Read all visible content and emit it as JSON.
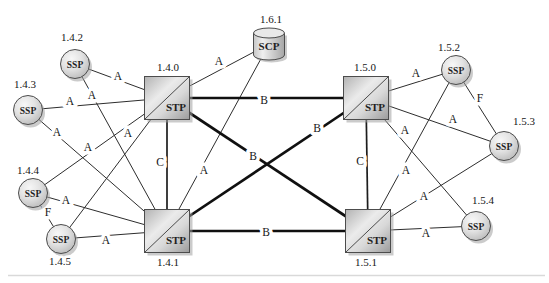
{
  "palette": {
    "background": "#ffffff",
    "line_thin": "#2d2d2d",
    "line_bold": "#101010",
    "node_border": "#4c4c4c",
    "node_fill_light": "#ececec",
    "node_fill_dark": "#9e9e9e",
    "shadow": "#a0a0a0",
    "text": "#161616",
    "page_rule": "#d9d9d9"
  },
  "diagram": {
    "nodes": [
      {
        "id": "1.4.0",
        "kind": "stp",
        "body_text": "STP",
        "label": "1.4.0",
        "x": 167,
        "y": 98,
        "label_x": 168,
        "label_y": 67
      },
      {
        "id": "1.4.1",
        "kind": "stp",
        "body_text": "STP",
        "label": "1.4.1",
        "x": 167,
        "y": 231,
        "label_x": 168,
        "label_y": 262
      },
      {
        "id": "1.5.0",
        "kind": "stp",
        "body_text": "STP",
        "label": "1.5.0",
        "x": 366,
        "y": 98,
        "label_x": 365,
        "label_y": 67
      },
      {
        "id": "1.5.1",
        "kind": "stp",
        "body_text": "STP",
        "label": "1.5.1",
        "x": 368,
        "y": 231,
        "label_x": 366,
        "label_y": 262
      },
      {
        "id": "1.6.1",
        "kind": "scp",
        "body_text": "SCP",
        "label": "1.6.1",
        "x": 269,
        "y": 44,
        "label_x": 271,
        "label_y": 19
      },
      {
        "id": "1.4.2",
        "kind": "ssp",
        "body_text": "SSP",
        "label": "1.4.2",
        "x": 75,
        "y": 64,
        "label_x": 72,
        "label_y": 37
      },
      {
        "id": "1.4.3",
        "kind": "ssp",
        "body_text": "SSP",
        "label": "1.4.3",
        "x": 28,
        "y": 110,
        "label_x": 25,
        "label_y": 84
      },
      {
        "id": "1.4.4",
        "kind": "ssp",
        "body_text": "SSP",
        "label": "1.4.4",
        "x": 33,
        "y": 193,
        "label_x": 28,
        "label_y": 170
      },
      {
        "id": "1.4.5",
        "kind": "ssp",
        "body_text": "SSP",
        "label": "1.4.5",
        "x": 61,
        "y": 239,
        "label_x": 60,
        "label_y": 261
      },
      {
        "id": "1.5.2",
        "kind": "ssp",
        "body_text": "SSP",
        "label": "1.5.2",
        "x": 456,
        "y": 70,
        "label_x": 449,
        "label_y": 47
      },
      {
        "id": "1.5.3",
        "kind": "ssp",
        "body_text": "SSP",
        "label": "1.5.3",
        "x": 504,
        "y": 146,
        "label_x": 524,
        "label_y": 121
      },
      {
        "id": "1.5.4",
        "kind": "ssp",
        "body_text": "SSP",
        "label": "1.5.4",
        "x": 476,
        "y": 226,
        "label_x": 483,
        "label_y": 200
      }
    ],
    "links": [
      {
        "from": "1.4.2",
        "to": "1.4.0",
        "type": "A",
        "label_x": 118,
        "label_y": 76
      },
      {
        "from": "1.4.2",
        "to": "1.4.1",
        "type": "A",
        "label_x": 92,
        "label_y": 95
      },
      {
        "from": "1.4.3",
        "to": "1.4.0",
        "type": "A",
        "label_x": 70,
        "label_y": 101
      },
      {
        "from": "1.4.3",
        "to": "1.4.1",
        "type": "A",
        "label_x": 57,
        "label_y": 132
      },
      {
        "from": "1.4.4",
        "to": "1.4.0",
        "type": "A",
        "label_x": 88,
        "label_y": 147
      },
      {
        "from": "1.4.5",
        "to": "1.4.0",
        "type": "A",
        "label_x": 128,
        "label_y": 133
      },
      {
        "from": "1.4.4",
        "to": "1.4.1",
        "type": "A",
        "label_x": 66,
        "label_y": 200
      },
      {
        "from": "1.4.5",
        "to": "1.4.1",
        "type": "A",
        "label_x": 106,
        "label_y": 240
      },
      {
        "from": "1.4.4",
        "to": "1.4.5",
        "type": "F",
        "label_x": 48,
        "label_y": 212
      },
      {
        "from": "1.6.1",
        "to": "1.4.0",
        "type": "A",
        "label_x": 219,
        "label_y": 61
      },
      {
        "from": "1.6.1",
        "to": "1.4.1",
        "type": "A",
        "label_x": 204,
        "label_y": 170
      },
      {
        "from": "1.4.0",
        "to": "1.5.0",
        "type": "B",
        "label_x": 264,
        "label_y": 100
      },
      {
        "from": "1.4.1",
        "to": "1.5.1",
        "type": "B",
        "label_x": 266,
        "label_y": 232
      },
      {
        "from": "1.4.0",
        "to": "1.5.1",
        "type": "B",
        "label_x": 253,
        "label_y": 156
      },
      {
        "from": "1.4.1",
        "to": "1.5.0",
        "type": "B",
        "label_x": 317,
        "label_y": 128
      },
      {
        "from": "1.4.0",
        "to": "1.4.1",
        "type": "C",
        "label_x": 160,
        "label_y": 162
      },
      {
        "from": "1.5.0",
        "to": "1.5.1",
        "type": "C",
        "label_x": 360,
        "label_y": 161
      },
      {
        "from": "1.5.0",
        "to": "1.5.2",
        "type": "A",
        "label_x": 416,
        "label_y": 73
      },
      {
        "from": "1.5.0",
        "to": "1.5.3",
        "type": "A",
        "label_x": 453,
        "label_y": 119
      },
      {
        "from": "1.5.0",
        "to": "1.5.4",
        "type": "A",
        "label_x": 405,
        "label_y": 130
      },
      {
        "from": "1.5.1",
        "to": "1.5.2",
        "type": "A",
        "label_x": 406,
        "label_y": 170
      },
      {
        "from": "1.5.1",
        "to": "1.5.3",
        "type": "A",
        "label_x": 424,
        "label_y": 196
      },
      {
        "from": "1.5.1",
        "to": "1.5.4",
        "type": "A",
        "label_x": 426,
        "label_y": 233
      },
      {
        "from": "1.5.2",
        "to": "1.5.3",
        "type": "F",
        "label_x": 480,
        "label_y": 98
      }
    ]
  }
}
